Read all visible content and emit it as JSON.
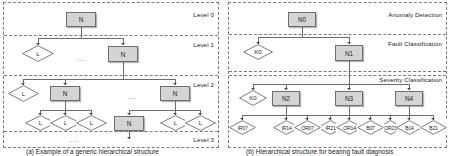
{
  "figure": {
    "panel_a": {
      "name": "generic-hierarchical-tree",
      "caption": "(a) Example of a generic hierarchical structure",
      "band_labels": [
        "Level 0",
        "Level 1",
        "Level 2",
        "Level 3"
      ],
      "node_internal_label": "N",
      "node_leaf_label": "L",
      "ellipsis": "...",
      "nodes": [
        {
          "id": "a-root",
          "label": "N",
          "type": "box",
          "level": 0
        },
        {
          "id": "a-l1-leaf",
          "label": "L",
          "type": "diamond",
          "level": 1
        },
        {
          "id": "a-l1-node",
          "label": "N",
          "type": "box",
          "level": 1
        },
        {
          "id": "a-l2-leaf",
          "label": "L",
          "type": "diamond",
          "level": 2
        },
        {
          "id": "a-l2-node1",
          "label": "N",
          "type": "box",
          "level": 2
        },
        {
          "id": "a-l2-node2",
          "label": "N",
          "type": "box",
          "level": 2
        },
        {
          "id": "a-l3-leaf1",
          "label": "L",
          "type": "diamond",
          "level": 3
        },
        {
          "id": "a-l3-leaf2",
          "label": "L",
          "type": "diamond",
          "level": 3
        },
        {
          "id": "a-l3-leaf3",
          "label": "L",
          "type": "diamond",
          "level": 3
        },
        {
          "id": "a-l3-node",
          "label": "N",
          "type": "box",
          "level": 3
        },
        {
          "id": "a-l3-leaf4",
          "label": "L",
          "type": "diamond",
          "level": 3
        },
        {
          "id": "a-l3-leaf5",
          "label": "L",
          "type": "diamond",
          "level": 3
        }
      ]
    },
    "panel_b": {
      "name": "fault-diagnosis-tree",
      "caption": "(b) Hierarchical structure for bearing fault diagnosis",
      "band_labels": [
        "Anomaly Detection",
        "Fault Classification",
        "Severity Classification"
      ],
      "nodes": [
        {
          "id": "b-n0",
          "label": "N0",
          "type": "box"
        },
        {
          "id": "b-k0-a",
          "label": "K0",
          "type": "diamond"
        },
        {
          "id": "b-n1",
          "label": "N1",
          "type": "box"
        },
        {
          "id": "b-k0-b",
          "label": "K0",
          "type": "diamond"
        },
        {
          "id": "b-n2",
          "label": "N2",
          "type": "box"
        },
        {
          "id": "b-n3",
          "label": "N3",
          "type": "box"
        },
        {
          "id": "b-n4",
          "label": "N4",
          "type": "box"
        }
      ],
      "leaves_group1": [
        "IR07",
        "IR14",
        "IR21"
      ],
      "leaves_group2": [
        "OR07",
        "OR14",
        "OR21"
      ],
      "leaves_group3": [
        "B07",
        "B14",
        "B21"
      ]
    }
  }
}
